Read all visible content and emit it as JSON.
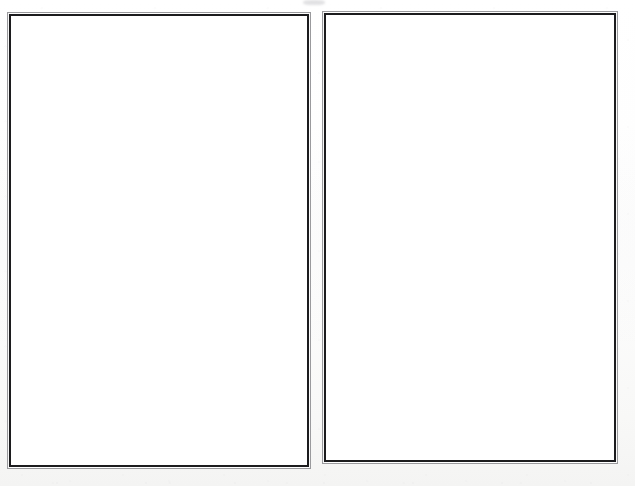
{
  "document": {
    "kind": "scanned-page",
    "description": "Scanned document page containing two blank bordered frames side by side",
    "page_background": "#fdfdfd",
    "frame_border_color": "#1c1c1e",
    "frame_outer_border_color": "#9a9a9d",
    "frame_fill_color": "#ffffff",
    "canvas": {
      "width": 635,
      "height": 486
    }
  },
  "frames": [
    {
      "id": "left-frame",
      "label": "",
      "content": "",
      "x": 7,
      "y": 12,
      "width": 304,
      "height": 457
    },
    {
      "id": "right-frame",
      "label": "",
      "content": "",
      "x": 322,
      "y": 11,
      "width": 296,
      "height": 453
    }
  ],
  "artifacts": {
    "smudge": {
      "x": 303,
      "y": 0,
      "width": 22,
      "height": 5
    },
    "ghost_band": {
      "y": 120,
      "height": 230
    }
  }
}
